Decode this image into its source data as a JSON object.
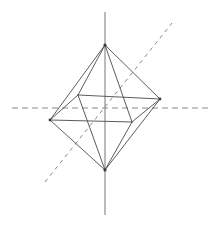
{
  "figure": {
    "canvas": {
      "width": 224,
      "height": 226,
      "background": "#ffffff"
    },
    "colors": {
      "edge": "#4a4a4a",
      "axis_solid": "#777777",
      "axis_dashed": "#8a8a8a",
      "vertex": "#3a3a3a",
      "background": "#ffffff"
    },
    "vertices": [
      {
        "name": "top-apex",
        "x": 105,
        "y": 45
      },
      {
        "name": "bottom-apex",
        "x": 105,
        "y": 170
      },
      {
        "name": "equator-left",
        "x": 50,
        "y": 120
      },
      {
        "name": "equator-right",
        "x": 160,
        "y": 99
      },
      {
        "name": "equator-far",
        "x": 78,
        "y": 95
      },
      {
        "name": "equator-near",
        "x": 132,
        "y": 122
      }
    ],
    "edges": [
      {
        "name": "top-to-left",
        "from": "top-apex",
        "to": "equator-left"
      },
      {
        "name": "top-to-right",
        "from": "top-apex",
        "to": "equator-right"
      },
      {
        "name": "top-to-far",
        "from": "top-apex",
        "to": "equator-far"
      },
      {
        "name": "top-to-near",
        "from": "top-apex",
        "to": "equator-near"
      },
      {
        "name": "bottom-to-left",
        "from": "bottom-apex",
        "to": "equator-left"
      },
      {
        "name": "bottom-to-right",
        "from": "bottom-apex",
        "to": "equator-right"
      },
      {
        "name": "bottom-to-far",
        "from": "bottom-apex",
        "to": "equator-far"
      },
      {
        "name": "bottom-to-near",
        "from": "bottom-apex",
        "to": "equator-near"
      },
      {
        "name": "equator-left-far",
        "from": "equator-left",
        "to": "equator-far"
      },
      {
        "name": "equator-far-right",
        "from": "equator-far",
        "to": "equator-right"
      },
      {
        "name": "equator-right-near",
        "from": "equator-right",
        "to": "equator-near"
      },
      {
        "name": "equator-near-left",
        "from": "equator-near",
        "to": "equator-left"
      }
    ],
    "axes": [
      {
        "name": "vertical-axis",
        "style": "solid",
        "x1": 105,
        "y1": 12,
        "x2": 105,
        "y2": 215
      },
      {
        "name": "horizontal-axis",
        "style": "dashed",
        "x1": 12,
        "y1": 108,
        "x2": 212,
        "y2": 108,
        "dash": "6 4"
      },
      {
        "name": "diagonal-axis",
        "style": "dashed",
        "x1": 45,
        "y1": 182,
        "x2": 172,
        "y2": 23,
        "dash": "4 4"
      }
    ]
  }
}
